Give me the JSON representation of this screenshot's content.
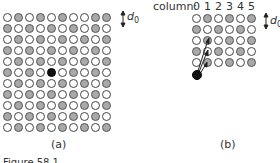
{
  "panel_a": {
    "label": "(a)",
    "spacing_label": "d",
    "spacing_sub": "0",
    "rows": [
      "WGWGWGWWGG",
      "GWGWGWGWGW",
      "WGWGWGWGWG",
      "GWGWGWGWGW",
      "WGWGWGWGWG",
      "GWGWBWGWGW",
      "WGWGWGWGWG",
      "GWGWGWGWGW",
      "WGWGWGWGWG",
      "GWGWGWGWGW",
      "WGWGWGWGWG"
    ]
  },
  "panel_b": {
    "label": "(b)",
    "column_label": "column:",
    "column_numbers": [
      "0",
      "1",
      "2",
      "3",
      "4",
      "5"
    ],
    "spacing_label": "d",
    "spacing_sub": "0",
    "rows": [
      "WGWGWG",
      "GWGWGW",
      "WGWGWG",
      "GWGWGW",
      "WGWGWG"
    ]
  },
  "caption": "Figure 58.1"
}
